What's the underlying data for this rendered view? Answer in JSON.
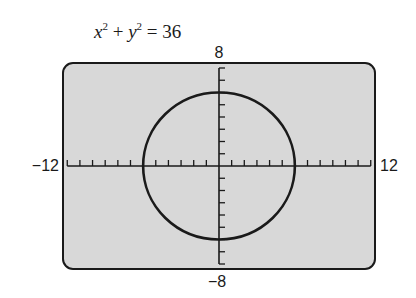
{
  "chart_data": {
    "type": "line",
    "title_parts": {
      "x": "x",
      "y": "y",
      "exp": "2",
      "plus": "+",
      "eq": "=",
      "rhs": "36"
    },
    "equation": "x^2 + y^2 = 36",
    "curve": {
      "kind": "circle",
      "center": [
        0,
        0
      ],
      "radius": 6
    },
    "xlim": [
      -12,
      12
    ],
    "ylim": [
      -8,
      8
    ],
    "xscale": 1,
    "yscale": 1,
    "tick_labels": {
      "xmin": "−12",
      "xmax": "12",
      "ymin": "−8",
      "ymax": "8"
    },
    "grid": false,
    "colors": {
      "panel": "#d8d8d8",
      "ink": "#1a1a1a"
    }
  }
}
